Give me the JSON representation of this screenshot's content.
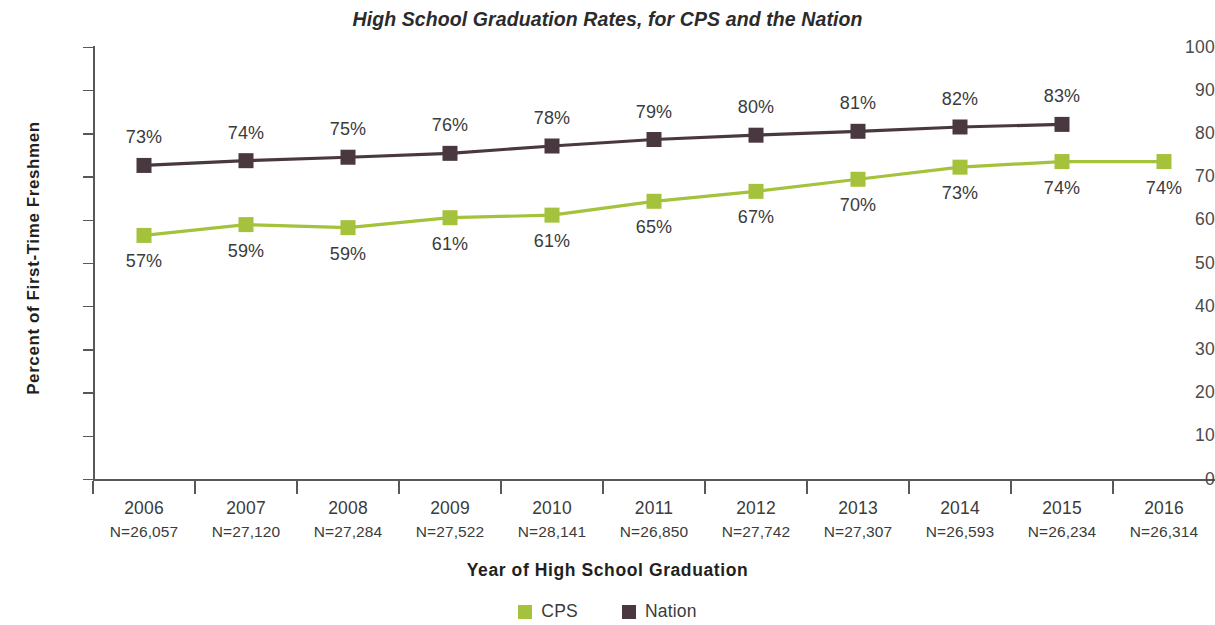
{
  "chart_data": {
    "type": "line",
    "title": "High School Graduation Rates, for CPS and the Nation",
    "xlabel": "Year of High School Graduation",
    "ylabel": "Percent of First-Time Freshmen",
    "categories": [
      "2006",
      "2007",
      "2008",
      "2009",
      "2010",
      "2011",
      "2012",
      "2013",
      "2014",
      "2015",
      "2016"
    ],
    "category_sublabels": [
      "N=26,057",
      "N=27,120",
      "N=27,284",
      "N=27,522",
      "N=28,141",
      "N=26,850",
      "N=27,742",
      "N=27,307",
      "N=26,593",
      "N=26,234",
      "N=26,314"
    ],
    "ylim": [
      0,
      100
    ],
    "yticks": [
      0,
      10,
      20,
      30,
      40,
      50,
      60,
      70,
      80,
      90,
      100
    ],
    "ytick_labels": [
      "0",
      "10",
      "20",
      "30",
      "40",
      "50",
      "60",
      "70",
      "80",
      "90",
      "100"
    ],
    "grid": false,
    "legend_position": "bottom",
    "series": [
      {
        "name": "CPS",
        "color": "#a4c23c",
        "label_position": "below",
        "values": [
          57,
          59,
          59,
          61,
          61,
          65,
          67,
          70,
          73,
          74,
          74
        ],
        "point_labels": [
          "57%",
          "59%",
          "59%",
          "61%",
          "61%",
          "65%",
          "67%",
          "70%",
          "73%",
          "74%",
          "74%"
        ],
        "plot_values": [
          56.5,
          59,
          58.3,
          60.6,
          61.2,
          64.4,
          66.7,
          69.5,
          72.3,
          73.6,
          73.6
        ]
      },
      {
        "name": "Nation",
        "color": "#4a3840",
        "label_position": "above",
        "values": [
          73,
          74,
          75,
          76,
          78,
          79,
          80,
          81,
          82,
          83,
          null
        ],
        "point_labels": [
          "73%",
          "74%",
          "75%",
          "76%",
          "78%",
          "79%",
          "80%",
          "81%",
          "82%",
          "83%",
          null
        ],
        "plot_values": [
          72.7,
          73.8,
          74.6,
          75.5,
          77.2,
          78.7,
          79.7,
          80.6,
          81.6,
          82.2,
          null
        ]
      }
    ]
  },
  "legend": {
    "items": [
      {
        "label": "CPS",
        "color": "#a4c23c"
      },
      {
        "label": "Nation",
        "color": "#4a3840"
      }
    ]
  }
}
